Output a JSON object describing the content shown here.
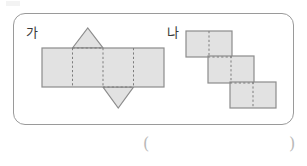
{
  "page": {
    "width": 307,
    "height": 166,
    "background": "#ffffff"
  },
  "colors": {
    "face_fill": "#e2e2e2",
    "solid_edge": "#8c8c8c",
    "fold_line": "#7d7d7d",
    "panel_border": "#9a9a9a",
    "label_text": "#3a3a3a",
    "paren_text": "#b9b9b9"
  },
  "panel": {
    "shape": "rounded-rectangle",
    "x": 13,
    "y": 13,
    "width": 281,
    "height": 112
  },
  "figures": [
    {
      "id": "ga",
      "label": "가",
      "label_x": 26,
      "label_y": 26,
      "description": "net made of a horizontal strip of four squares with one triangle pointing up above the second square and one triangle pointing down below the third square",
      "square_size": 30.5,
      "strip": {
        "x": 42,
        "y": 48,
        "width": 122,
        "height": 39,
        "squares": 4
      },
      "fold_lines_x": [
        72.5,
        103,
        133.5
      ],
      "triangles": [
        {
          "position": "top",
          "over_square_index": 2,
          "apex_x": 87.5,
          "apex_y": 28,
          "base_y": 48,
          "base_x1": 72.5,
          "base_x2": 103
        },
        {
          "position": "bottom",
          "over_square_index": 3,
          "apex_x": 118,
          "apex_y": 108,
          "base_y": 87,
          "base_x1": 103,
          "base_x2": 133.5
        }
      ]
    },
    {
      "id": "na",
      "label": "나",
      "label_x": 167,
      "label_y": 26,
      "description": "staircase arrangement of three equal rectangles stepping down to the right, each split by a vertical dashed fold line through its centre",
      "rectangles": [
        {
          "x": 186,
          "y": 31,
          "width": 46,
          "height": 26,
          "fold_x": 209
        },
        {
          "x": 208,
          "y": 56,
          "width": 46,
          "height": 27,
          "fold_x": 231
        },
        {
          "x": 230,
          "y": 82,
          "width": 46,
          "height": 26,
          "fold_x": 253
        }
      ]
    }
  ],
  "answer": {
    "open_paren": "(",
    "close_paren": ")",
    "open_x": 143,
    "close_x": 289,
    "y": 136
  }
}
